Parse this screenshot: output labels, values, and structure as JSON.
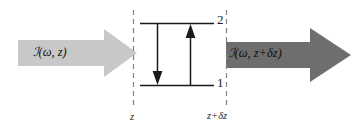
{
  "figure": {
    "background_color": "#ffffff"
  },
  "colors": {
    "incoming_arrow": "#c8c8c8",
    "outgoing_arrow": "#6e6e6e",
    "line": "#1a1a1a",
    "dashed_line": "#808080",
    "text": "#1a1a1a"
  },
  "beams": {
    "incoming": {
      "label": "ℐ(ω, z)",
      "label_script_i": "ℐ",
      "label_rest": "(ω, z)",
      "direction": "right",
      "shade": "light"
    },
    "outgoing": {
      "label": "ℐ(ω, z+δz)",
      "label_script_i": "ℐ",
      "label_rest": "(ω, z+δz)",
      "direction": "right",
      "shade": "dark"
    }
  },
  "slab": {
    "left_boundary_label": "z",
    "right_boundary_label": "z+δz",
    "boundary_style": "dashed"
  },
  "energy_levels": {
    "upper": {
      "label": "2",
      "name": "upper-level"
    },
    "lower": {
      "label": "1",
      "name": "lower-level"
    },
    "transitions": [
      {
        "name": "emission",
        "direction": "down",
        "from": "2",
        "to": "1"
      },
      {
        "name": "absorption",
        "direction": "up",
        "from": "1",
        "to": "2"
      }
    ]
  }
}
